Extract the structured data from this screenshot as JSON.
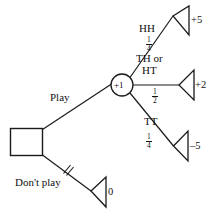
{
  "figure": {
    "type": "decision-tree",
    "title": "",
    "stroke_color": "#1a1a1a",
    "text_color": "#111111",
    "background": "#ffffff"
  },
  "nodes": {
    "decision_square": {
      "label": "",
      "shape": "square"
    },
    "chance_circle": {
      "label": "+1",
      "shape": "circle"
    }
  },
  "branches": {
    "play": {
      "label": "Play",
      "chosen": true
    },
    "dont_play": {
      "label": "Don't play",
      "chosen": false,
      "marker": "strikethrough"
    },
    "hh": {
      "label": "HH",
      "prob_num": "1",
      "prob_den": "4"
    },
    "th_or_ht": {
      "label_line1": "TH or",
      "label_line2": "HT",
      "prob_num": "1",
      "prob_den": "2"
    },
    "tt": {
      "label": "TT",
      "prob_num": "1",
      "prob_den": "4"
    }
  },
  "payoffs": {
    "hh": "+5",
    "th_or_ht": "+2",
    "tt": "–5",
    "dont_play": "0"
  }
}
